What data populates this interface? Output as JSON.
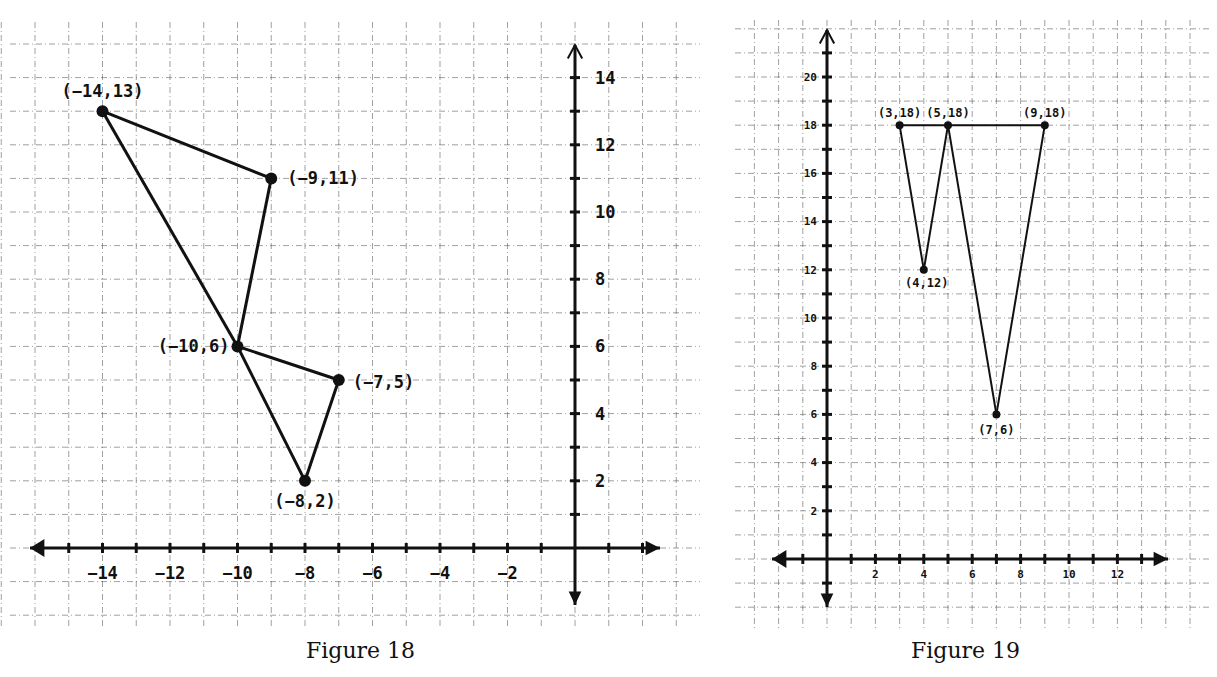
{
  "chart_data": [
    {
      "type": "line",
      "title": "Figure 18",
      "xlabel": "",
      "ylabel": "",
      "xlim": [
        -16,
        2
      ],
      "ylim": [
        -1.5,
        15
      ],
      "grid": true,
      "x_tick_labels": [
        "-14",
        "-12",
        "-10",
        "-8",
        "-6",
        "-4",
        "-2"
      ],
      "y_tick_labels": [
        "2",
        "4",
        "6",
        "8",
        "10",
        "12",
        "14"
      ],
      "points": [
        {
          "label": "(-14,13)",
          "x": -14,
          "y": 13
        },
        {
          "label": "(-9,11)",
          "x": -9,
          "y": 11
        },
        {
          "label": "(-10,6)",
          "x": -10,
          "y": 6
        },
        {
          "label": "(-7,5)",
          "x": -7,
          "y": 5
        },
        {
          "label": "(-8,2)",
          "x": -8,
          "y": 2
        }
      ],
      "segments": [
        [
          [
            -14,
            13
          ],
          [
            -9,
            11
          ]
        ],
        [
          [
            -9,
            11
          ],
          [
            -10,
            6
          ]
        ],
        [
          [
            -14,
            13
          ],
          [
            -10,
            6
          ]
        ],
        [
          [
            -10,
            6
          ],
          [
            -7,
            5
          ]
        ],
        [
          [
            -10,
            6
          ],
          [
            -8,
            2
          ]
        ],
        [
          [
            -7,
            5
          ],
          [
            -8,
            2
          ]
        ]
      ]
    },
    {
      "type": "line",
      "title": "Figure 19",
      "xlabel": "",
      "ylabel": "",
      "xlim": [
        -2,
        14
      ],
      "ylim": [
        -2,
        22
      ],
      "grid": true,
      "x_tick_labels": [
        "2",
        "4",
        "6",
        "8",
        "10",
        "12"
      ],
      "y_tick_labels": [
        "2",
        "4",
        "6",
        "8",
        "10",
        "12",
        "14",
        "16",
        "18",
        "20"
      ],
      "points": [
        {
          "label": "(3,18)",
          "x": 3,
          "y": 18
        },
        {
          "label": "(5,18)",
          "x": 5,
          "y": 18
        },
        {
          "label": "(9,18)",
          "x": 9,
          "y": 18
        },
        {
          "label": "(4,12)",
          "x": 4,
          "y": 12
        },
        {
          "label": "(7,6)",
          "x": 7,
          "y": 6
        }
      ],
      "segments": [
        [
          [
            3,
            18
          ],
          [
            9,
            18
          ]
        ],
        [
          [
            3,
            18
          ],
          [
            4,
            12
          ]
        ],
        [
          [
            4,
            12
          ],
          [
            5,
            18
          ]
        ],
        [
          [
            5,
            18
          ],
          [
            7,
            6
          ]
        ],
        [
          [
            7,
            6
          ],
          [
            9,
            18
          ]
        ]
      ]
    }
  ],
  "captions": {
    "fig18": "Figure 18",
    "fig19": "Figure 19"
  }
}
